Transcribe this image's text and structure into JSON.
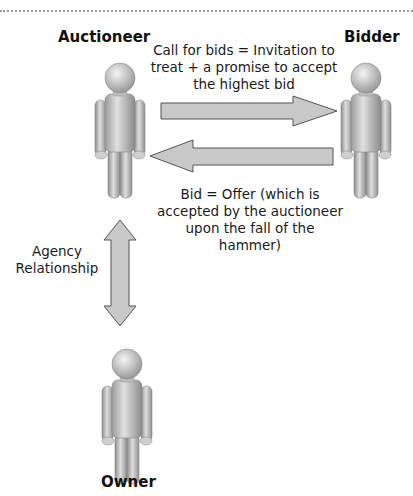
{
  "header": {
    "cut_caption": "...contract formed in a traditional auction"
  },
  "actors": {
    "auctioneer": "Auctioneer",
    "bidder": "Bidder",
    "owner": "Owner"
  },
  "relations": {
    "call_for_bids": "Call for bids = Invitation to treat + a promise to accept the highest bid",
    "call_for_bids_lines": [
      "Call for bids = Invitation to",
      "treat + a promise to accept",
      "the highest bid"
    ],
    "bid_offer_lines": [
      "Bid = Offer (which is",
      "accepted by the auctioneer",
      "upon the fall of the",
      "hammer)"
    ],
    "agency_lines": [
      "Agency",
      "Relationship"
    ]
  },
  "colors": {
    "arrow_fill": "#c8c8c8",
    "arrow_stroke": "#555555",
    "figure_light": "#e6e6e6",
    "figure_dark": "#8f8f8f"
  }
}
